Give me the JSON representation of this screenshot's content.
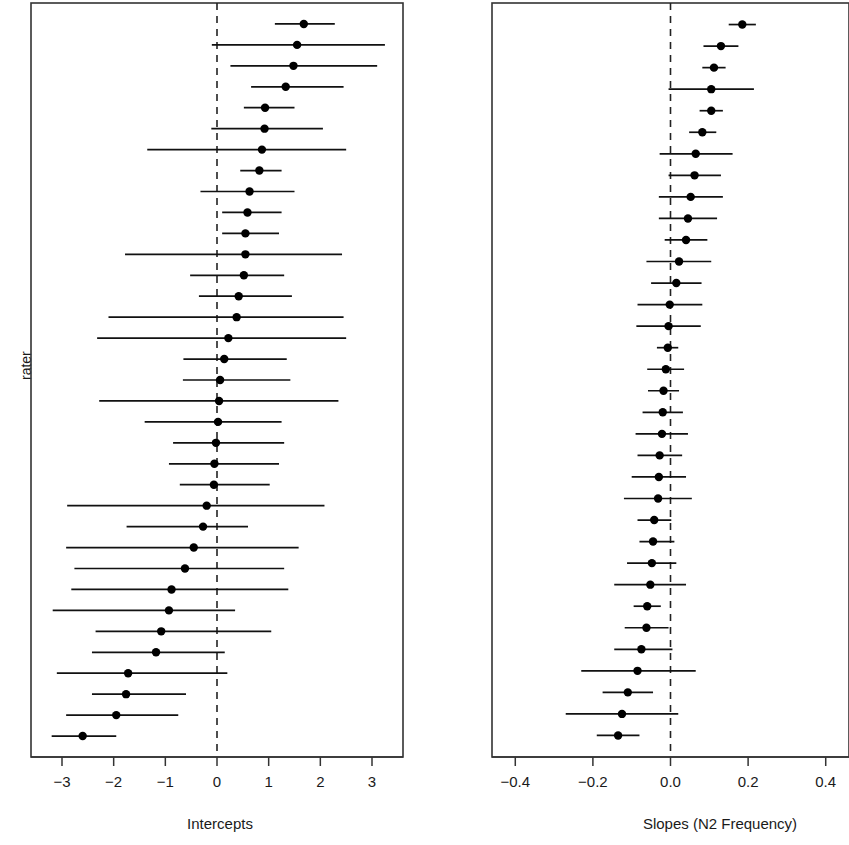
{
  "figure": {
    "y_axis_label": "rater",
    "background": "#ffffff",
    "ink_color": "#111111"
  },
  "chart_data": [
    {
      "type": "scatter",
      "name": "intercepts-caterpillar",
      "title": "",
      "xlabel": "Intercepts",
      "ylabel": "rater",
      "xlim": [
        -3.6,
        3.6
      ],
      "xticks": [
        -3,
        -2,
        -1,
        0,
        1,
        2,
        3
      ],
      "xtick_labels": [
        "−3",
        "−2",
        "−1",
        "0",
        "1",
        "2",
        "3"
      ],
      "grid": false,
      "legend": "none",
      "reference_line": 0,
      "reference_line_style": "dashed",
      "n_points": 33,
      "point_order": "descending by estimate",
      "estimates": [
        1.68,
        1.55,
        1.48,
        1.33,
        0.93,
        0.92,
        0.87,
        0.82,
        0.63,
        0.59,
        0.55,
        0.55,
        0.52,
        0.42,
        0.38,
        0.22,
        0.14,
        0.06,
        0.04,
        0.02,
        -0.02,
        -0.05,
        -0.06,
        -0.2,
        -0.27,
        -0.45,
        -0.62,
        -0.88,
        -0.93,
        -1.08,
        -1.18,
        -1.72,
        -1.76,
        -1.95,
        -2.6
      ],
      "ci_low": [
        1.12,
        -0.1,
        0.26,
        0.66,
        0.52,
        -0.11,
        -1.35,
        0.45,
        -0.32,
        0.1,
        0.1,
        -1.78,
        -0.52,
        -0.35,
        -2.1,
        -2.32,
        -0.65,
        -0.66,
        -2.28,
        -1.4,
        -0.85,
        -0.93,
        -0.72,
        -2.9,
        -1.75,
        -2.92,
        -2.76,
        -2.82,
        -3.18,
        -2.35,
        -2.42,
        -3.1,
        -2.42,
        -2.92,
        -3.2
      ],
      "ci_high": [
        2.28,
        3.25,
        3.1,
        2.45,
        1.5,
        2.05,
        2.5,
        1.25,
        1.5,
        1.25,
        1.2,
        2.42,
        1.3,
        1.45,
        2.45,
        2.5,
        1.35,
        1.42,
        2.35,
        1.25,
        1.3,
        1.2,
        1.02,
        2.08,
        0.6,
        1.58,
        1.3,
        1.38,
        0.35,
        1.05,
        0.15,
        0.2,
        -0.6,
        -0.75,
        -1.95
      ]
    },
    {
      "type": "scatter",
      "name": "slopes-caterpillar",
      "title": "",
      "xlabel": "Slopes (N2 Frequency)",
      "ylabel": "rater",
      "xlim": [
        -0.46,
        0.46
      ],
      "xticks": [
        -0.4,
        -0.2,
        0.0,
        0.2,
        0.4
      ],
      "xtick_labels": [
        "−0.4",
        "−0.2",
        "0.0",
        "0.2",
        "0.4"
      ],
      "grid": false,
      "legend": "none",
      "reference_line": 0,
      "reference_line_style": "dashed",
      "n_points": 33,
      "point_order": "descending by estimate",
      "estimates": [
        0.185,
        0.13,
        0.112,
        0.105,
        0.105,
        0.082,
        0.065,
        0.062,
        0.052,
        0.045,
        0.04,
        0.022,
        0.015,
        -0.002,
        -0.005,
        -0.007,
        -0.012,
        -0.018,
        -0.02,
        -0.022,
        -0.028,
        -0.03,
        -0.032,
        -0.042,
        -0.045,
        -0.048,
        -0.052,
        -0.06,
        -0.062,
        -0.075,
        -0.085,
        -0.11,
        -0.125,
        -0.135
      ],
      "ci_low": [
        0.15,
        0.085,
        0.082,
        -0.005,
        0.075,
        0.048,
        -0.028,
        -0.005,
        -0.03,
        -0.03,
        -0.015,
        -0.062,
        -0.05,
        -0.085,
        -0.088,
        -0.035,
        -0.06,
        -0.058,
        -0.072,
        -0.09,
        -0.085,
        -0.1,
        -0.12,
        -0.085,
        -0.08,
        -0.112,
        -0.145,
        -0.095,
        -0.118,
        -0.145,
        -0.23,
        -0.175,
        -0.27,
        -0.19
      ],
      "ci_high": [
        0.22,
        0.175,
        0.142,
        0.215,
        0.135,
        0.118,
        0.16,
        0.13,
        0.135,
        0.12,
        0.095,
        0.105,
        0.08,
        0.082,
        0.078,
        0.02,
        0.035,
        0.022,
        0.032,
        0.045,
        0.03,
        0.04,
        0.055,
        0.002,
        0.01,
        0.015,
        0.04,
        -0.025,
        -0.005,
        0.005,
        0.065,
        -0.045,
        0.02,
        -0.08
      ]
    }
  ],
  "panels": {
    "left": {
      "x_axis_title": "Intercepts"
    },
    "right": {
      "x_axis_title": "Slopes (N2 Frequency)"
    }
  }
}
